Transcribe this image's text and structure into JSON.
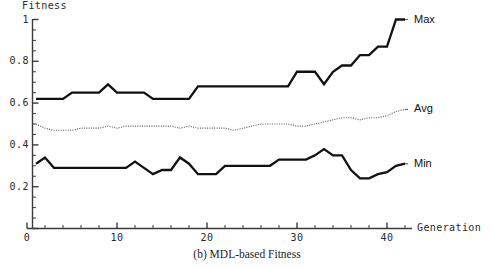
{
  "caption": "(b) MDL-based Fitness",
  "axis": {
    "y_title": "Fitness",
    "x_title": "Generation"
  },
  "labels": {
    "max": "Max",
    "avg": "Avg",
    "min": "Min"
  },
  "colors": {
    "axis": "#3b3b3b",
    "max_line": "#111111",
    "min_line": "#111111",
    "avg_line": "#5a5a5a",
    "background": "#ffffff"
  },
  "chart_data": {
    "type": "line",
    "title": "(b) MDL-based Fitness",
    "xlabel": "Generation",
    "ylabel": "Fitness",
    "xlim": [
      0,
      44
    ],
    "ylim": [
      0,
      1
    ],
    "xticks": [
      0,
      10,
      20,
      30,
      40
    ],
    "yticks": [
      0,
      0.2,
      0.4,
      0.6,
      0.8,
      1
    ],
    "grid": false,
    "legend": "right-inline-labels",
    "x": [
      1,
      2,
      3,
      4,
      5,
      6,
      7,
      8,
      9,
      10,
      11,
      12,
      13,
      14,
      15,
      16,
      17,
      18,
      19,
      20,
      21,
      22,
      23,
      24,
      25,
      26,
      27,
      28,
      29,
      30,
      31,
      32,
      33,
      34,
      35,
      36,
      37,
      38,
      39,
      40,
      41,
      42
    ],
    "series": [
      {
        "name": "Max",
        "style": "solid-thick",
        "values": [
          0.62,
          0.62,
          0.62,
          0.62,
          0.65,
          0.65,
          0.65,
          0.65,
          0.69,
          0.65,
          0.65,
          0.65,
          0.65,
          0.62,
          0.62,
          0.62,
          0.62,
          0.62,
          0.68,
          0.68,
          0.68,
          0.68,
          0.68,
          0.68,
          0.68,
          0.68,
          0.68,
          0.68,
          0.68,
          0.75,
          0.75,
          0.75,
          0.69,
          0.75,
          0.78,
          0.78,
          0.83,
          0.83,
          0.87,
          0.87,
          1.0,
          1.0
        ]
      },
      {
        "name": "Avg",
        "style": "dotted",
        "values": [
          0.5,
          0.48,
          0.47,
          0.47,
          0.47,
          0.48,
          0.48,
          0.48,
          0.49,
          0.48,
          0.49,
          0.49,
          0.49,
          0.49,
          0.49,
          0.49,
          0.48,
          0.49,
          0.48,
          0.48,
          0.48,
          0.48,
          0.47,
          0.48,
          0.49,
          0.5,
          0.5,
          0.5,
          0.5,
          0.49,
          0.49,
          0.5,
          0.51,
          0.52,
          0.53,
          0.53,
          0.52,
          0.53,
          0.53,
          0.54,
          0.56,
          0.57
        ]
      },
      {
        "name": "Min",
        "style": "solid-thick",
        "values": [
          0.31,
          0.34,
          0.29,
          0.29,
          0.29,
          0.29,
          0.29,
          0.29,
          0.29,
          0.29,
          0.29,
          0.32,
          0.29,
          0.26,
          0.28,
          0.28,
          0.34,
          0.31,
          0.26,
          0.26,
          0.26,
          0.3,
          0.3,
          0.3,
          0.3,
          0.3,
          0.3,
          0.33,
          0.33,
          0.33,
          0.33,
          0.35,
          0.38,
          0.35,
          0.35,
          0.28,
          0.24,
          0.24,
          0.26,
          0.27,
          0.3,
          0.31
        ]
      }
    ]
  }
}
